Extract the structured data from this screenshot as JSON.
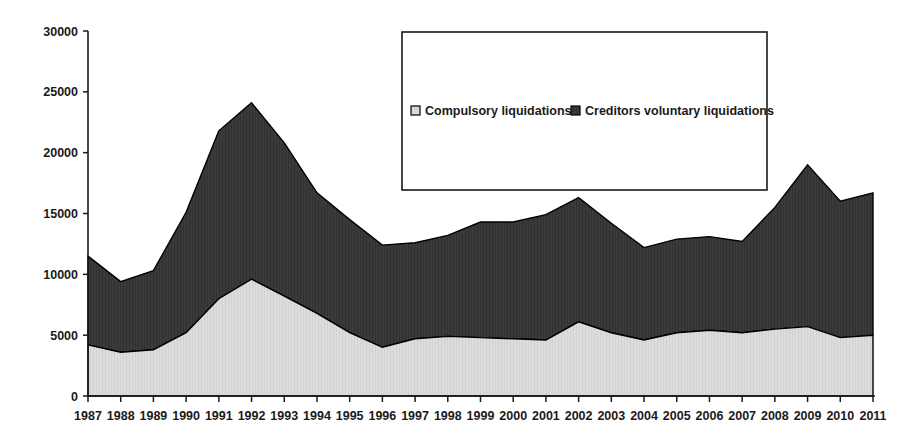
{
  "chart_data": {
    "type": "area",
    "title": "",
    "subtitle": "",
    "xlabel": "",
    "ylabel": "",
    "stacked": true,
    "grid": false,
    "legend_position": "top-center-inside",
    "ylim": [
      0,
      30000
    ],
    "ytick_labels": [
      "0",
      "5000",
      "10000",
      "15000",
      "20000",
      "25000",
      "30000"
    ],
    "ytick_values": [
      0,
      5000,
      10000,
      15000,
      20000,
      25000,
      30000
    ],
    "categories": [
      "1987",
      "1988",
      "1989",
      "1990",
      "1991",
      "1992",
      "1993",
      "1994",
      "1995",
      "1996",
      "1997",
      "1998",
      "1999",
      "2000",
      "2001",
      "2002",
      "2003",
      "2004",
      "2005",
      "2006",
      "2007",
      "2008",
      "2009",
      "2010",
      "2011"
    ],
    "series": [
      {
        "name": "Compulsory liquidations",
        "color": "#dcdcdc",
        "values": [
          4200,
          3600,
          3800,
          5200,
          8000,
          9600,
          8200,
          6800,
          5200,
          4000,
          4700,
          4900,
          4800,
          4700,
          4600,
          6100,
          5200,
          4600,
          5200,
          5400,
          5200,
          5500,
          5700,
          4800,
          5000
        ]
      },
      {
        "name": "Creditors voluntary liquidations",
        "color": "#3a3a3a",
        "values": [
          7300,
          5800,
          6500,
          9900,
          13800,
          14500,
          12600,
          9900,
          9300,
          8400,
          7900,
          8300,
          9500,
          9600,
          10300,
          10200,
          9000,
          7600,
          7700,
          7700,
          7500,
          10000,
          13300,
          11200,
          11700
        ]
      }
    ],
    "stacked_totals": [
      11500,
      9400,
      10300,
      15100,
      21800,
      24100,
      20800,
      16700,
      14500,
      12400,
      12600,
      13200,
      14300,
      14300,
      14900,
      16300,
      14200,
      12200,
      12900,
      13100,
      12700,
      15500,
      19000,
      16000,
      16700
    ]
  },
  "legend": {
    "entries": [
      {
        "label": "Compulsory liquidations",
        "swatch": "light-square-swatch"
      },
      {
        "label": "Creditors voluntary liquidations",
        "swatch": "dark-square-swatch"
      }
    ]
  },
  "colors": {
    "compulsory_fill": "#dcdcdc",
    "creditors_fill": "#3a3a3a",
    "axis": "#1a1a1a",
    "outline": "#000000",
    "background": "#ffffff"
  }
}
